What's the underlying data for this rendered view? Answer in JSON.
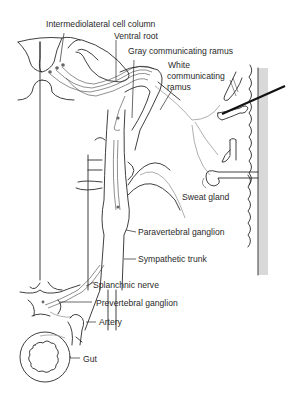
{
  "figure": {
    "colors": {
      "ink": "#2a2a2a",
      "skin_shade": "#d9d9d9",
      "background": "#ffffff"
    }
  },
  "labels": {
    "intermediolateral": "Intermediolateral cell column",
    "ventral_root": "Ventral root",
    "gray_ramus": "Gray communicating ramus",
    "white_ramus_1": "White",
    "white_ramus_2": "communicating",
    "white_ramus_3": "ramus",
    "sweat_gland": "Sweat gland",
    "paravertebral": "Paravertebral ganglion",
    "sympathetic_trunk": "Sympathetic trunk",
    "splanchnic": "Splanchnic nerve",
    "prevertebral": "Prevertebral ganglion",
    "artery": "Artery",
    "gut": "Gut"
  }
}
